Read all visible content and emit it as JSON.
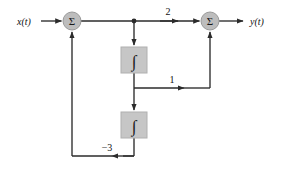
{
  "diagram": {
    "colors": {
      "line": "#2b2b2b",
      "block_fill": "#c6c6c6",
      "block_stroke": "#b0b0b0",
      "node_fill": "#bdbdbd",
      "node_stroke": "#9a9a9a",
      "text": "#111111",
      "background": "#ffffff"
    },
    "signals": {
      "input_label": "x(t)",
      "output_label": "y(t)"
    },
    "summers": [
      {
        "id": "input-summer",
        "glyph": "Σ",
        "cx": 72,
        "cy": 21,
        "r": 9
      },
      {
        "id": "output-summer",
        "glyph": "Σ",
        "cx": 210,
        "cy": 21,
        "r": 9
      }
    ],
    "integrators": [
      {
        "id": "integrator-1",
        "glyph": "∫",
        "x": 121,
        "y": 47,
        "w": 26,
        "h": 26
      },
      {
        "id": "integrator-2",
        "glyph": "∫",
        "x": 121,
        "y": 112,
        "w": 26,
        "h": 26
      }
    ],
    "gains": [
      {
        "id": "gain-forward-2",
        "label": "2",
        "x": 168,
        "y": 12
      },
      {
        "id": "gain-forward-1",
        "label": "1",
        "x": 172,
        "y": 80
      },
      {
        "id": "gain-feedback-minus-3",
        "label": "−3",
        "x": 107,
        "y": 147
      }
    ],
    "nodes": [
      {
        "id": "pickoff-node",
        "cx": 134,
        "cy": 21,
        "r": 2.4
      }
    ]
  }
}
